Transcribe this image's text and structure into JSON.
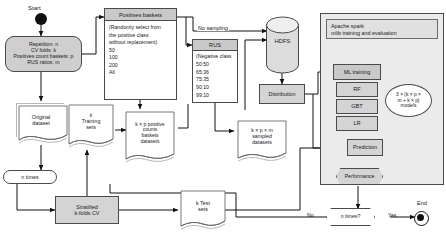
{
  "diagram": {
    "colors": {
      "fill_gray": "#d4d4d4",
      "header_gray": "#c9c9c9",
      "panel_bg": "#ebebeb",
      "stroke": "#4a4a4a"
    }
  },
  "start": {
    "label": "Start"
  },
  "end": {
    "label": "End"
  },
  "params": {
    "line1": "Repetition: n",
    "line2": "CV folds: k",
    "line3": "Positives count baskets: p",
    "line4": "RUS ratios: m"
  },
  "positives_baskets": {
    "header": "Positives baskets",
    "note_line1": "(Randomly select from",
    "note_line2": "the positive class",
    "note_line3": "without replacement)",
    "options": [
      "50",
      "100",
      "200",
      "All"
    ]
  },
  "rus": {
    "header": "RUS",
    "note": "(Negative class",
    "ratios": [
      "50:50",
      "65:36",
      "75:35",
      "90:10",
      "99:10"
    ]
  },
  "edges": {
    "no_sampling": "No sampling",
    "no": "No",
    "yes": "Yes"
  },
  "hdfs": {
    "label": "HDFS"
  },
  "distribution": {
    "label": "Distribution"
  },
  "spark": {
    "header_line1": "Apache spark",
    "header_line2": "mlib training and evaluation",
    "ml_training": "ML training",
    "algorithms": [
      "RF",
      "GBT",
      "LR"
    ],
    "models_line1": "3 × (k × p ×",
    "models_line2": "m + k × p)",
    "models_line3": "models",
    "prediction": "Prediction",
    "performance": "Performance"
  },
  "documents": {
    "original_dataset_line1": "Original",
    "original_dataset_line2": "dataset",
    "training_sets_line1": "k",
    "training_sets_line2": "Training",
    "training_sets_line3": "sets",
    "positive_baskets_line1": "k × p positive",
    "positive_baskets_line2": "counts",
    "positive_baskets_line3": "baskets",
    "positive_baskets_line4": "datasets",
    "sampled_line1": "k × p × m",
    "sampled_line2": "sampled",
    "sampled_line3": "datasets",
    "test_sets_line1": "k Test",
    "test_sets_line2": "sets"
  },
  "loops": {
    "n_times": "n times",
    "n_times_decision": "n times?"
  },
  "stratified": {
    "line1": "Stratified",
    "line2": "k-folds CV"
  }
}
